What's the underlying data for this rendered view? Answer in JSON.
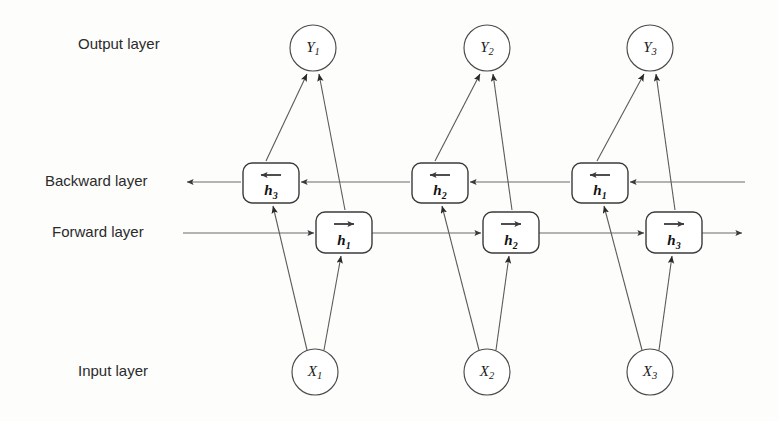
{
  "figure": {
    "background_color": "#fdfdfc",
    "line_color": "#5a5a5a"
  },
  "layer_labels": [
    {
      "id": "output",
      "text": "Output layer",
      "x": 78,
      "y": 45
    },
    {
      "id": "backward",
      "text": "Backward layer",
      "x": 45,
      "y": 182
    },
    {
      "id": "forward",
      "text": "Forward layer",
      "x": 52,
      "y": 233
    },
    {
      "id": "input",
      "text": "Input layer",
      "x": 78,
      "y": 372
    }
  ],
  "output_nodes": [
    {
      "id": "y1",
      "base": "Y",
      "sub": "1",
      "cx": 313,
      "cy": 48,
      "r": 23
    },
    {
      "id": "y2",
      "base": "Y",
      "sub": "2",
      "cx": 487,
      "cy": 48,
      "r": 23
    },
    {
      "id": "y3",
      "base": "Y",
      "sub": "3",
      "cx": 650,
      "cy": 48,
      "r": 23
    }
  ],
  "input_nodes": [
    {
      "id": "x1",
      "base": "X",
      "sub": "1",
      "cx": 315,
      "cy": 372,
      "r": 23
    },
    {
      "id": "x2",
      "base": "X",
      "sub": "2",
      "cx": 487,
      "cy": 372,
      "r": 23
    },
    {
      "id": "x3",
      "base": "X",
      "sub": "3",
      "cx": 650,
      "cy": 372,
      "r": 23
    }
  ],
  "backward_cells": [
    {
      "id": "bh3",
      "base": "h",
      "sub": "3",
      "direction": "left-arrow-overbar",
      "x": 243,
      "y": 163,
      "w": 56,
      "h": 40
    },
    {
      "id": "bh2",
      "base": "h",
      "sub": "2",
      "direction": "left-arrow-overbar",
      "x": 412,
      "y": 163,
      "w": 56,
      "h": 40
    },
    {
      "id": "bh1",
      "base": "h",
      "sub": "1",
      "direction": "left-arrow-overbar",
      "x": 572,
      "y": 163,
      "w": 56,
      "h": 40
    }
  ],
  "forward_cells": [
    {
      "id": "fh1",
      "base": "h",
      "sub": "1",
      "direction": "right-arrow-overbar",
      "x": 316,
      "y": 212,
      "w": 56,
      "h": 41
    },
    {
      "id": "fh2",
      "base": "h",
      "sub": "2",
      "direction": "right-arrow-overbar",
      "x": 483,
      "y": 212,
      "w": 56,
      "h": 41
    },
    {
      "id": "fh3",
      "base": "h",
      "sub": "3",
      "direction": "right-arrow-overbar",
      "x": 646,
      "y": 212,
      "w": 56,
      "h": 41
    }
  ],
  "rails": {
    "backward": {
      "y": 182,
      "x_start": 745,
      "x_end": 187,
      "direction": "right-to-left"
    },
    "forward": {
      "y": 233,
      "x_start": 183,
      "x_end": 742,
      "direction": "left-to-right"
    }
  },
  "edges": [
    {
      "from": "bh3",
      "to": "y1",
      "kind": "backward-to-output"
    },
    {
      "from": "fh1",
      "to": "y1",
      "kind": "forward-to-output"
    },
    {
      "from": "bh2",
      "to": "y2",
      "kind": "backward-to-output"
    },
    {
      "from": "fh2",
      "to": "y2",
      "kind": "forward-to-output"
    },
    {
      "from": "bh1",
      "to": "y3",
      "kind": "backward-to-output"
    },
    {
      "from": "fh3",
      "to": "y3",
      "kind": "forward-to-output"
    },
    {
      "from": "x1",
      "to": "bh3",
      "kind": "input-to-backward"
    },
    {
      "from": "x1",
      "to": "fh1",
      "kind": "input-to-forward"
    },
    {
      "from": "x2",
      "to": "bh2",
      "kind": "input-to-backward"
    },
    {
      "from": "x2",
      "to": "fh2",
      "kind": "input-to-forward"
    },
    {
      "from": "x3",
      "to": "bh1",
      "kind": "input-to-backward"
    },
    {
      "from": "x3",
      "to": "fh3",
      "kind": "input-to-forward"
    }
  ]
}
